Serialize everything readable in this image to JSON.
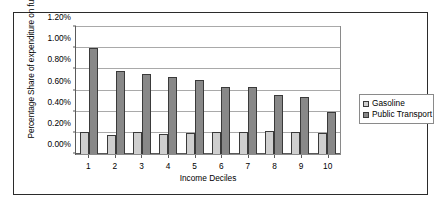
{
  "chart_data": {
    "type": "bar",
    "title": "",
    "xlabel": "Income Deciles",
    "ylabel": "Percentage Share of expenditure on fuel",
    "categories": [
      "1",
      "2",
      "3",
      "4",
      "5",
      "6",
      "7",
      "8",
      "9",
      "10"
    ],
    "series": [
      {
        "name": "Gasoline",
        "color": "#cfcfcf",
        "values": [
          0.21,
          0.18,
          0.21,
          0.19,
          0.2,
          0.21,
          0.21,
          0.22,
          0.21,
          0.2
        ]
      },
      {
        "name": "Public Transport",
        "color": "#888888",
        "values": [
          1.0,
          0.78,
          0.76,
          0.73,
          0.7,
          0.63,
          0.63,
          0.56,
          0.54,
          0.4
        ]
      }
    ],
    "ylim": [
      0.0,
      1.2
    ],
    "ytick_values": [
      0.0,
      0.2,
      0.4,
      0.6,
      0.8,
      1.0,
      1.2
    ],
    "ytick_labels": [
      "0.00%",
      "0.20%",
      "0.40%",
      "0.60%",
      "0.80%",
      "1.00%",
      "1.20%"
    ],
    "grid": true,
    "legend_position": "right"
  },
  "legend": {
    "entries": [
      {
        "label": "Gasoline"
      },
      {
        "label": "Public Transport"
      }
    ]
  }
}
